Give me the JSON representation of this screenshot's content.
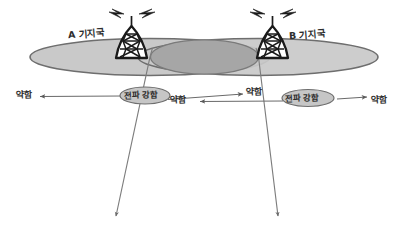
{
  "diagram": {
    "colors": {
      "coverage_fill": "#c9c9c9",
      "overlap_fill": "#a8a8a8",
      "outline": "#6e6e6e",
      "ink": "#333333",
      "background": "#ffffff"
    },
    "stations": [
      {
        "id": "station-a",
        "label": "A 기지국",
        "tower_x": 130,
        "tower_y": 22
      },
      {
        "id": "station-b",
        "label": "B 기지국",
        "tower_x": 272,
        "tower_y": 22
      }
    ],
    "coverage": [
      {
        "id": "coverage-a",
        "cx": 150,
        "cy": 57,
        "rx": 120,
        "ry": 18
      },
      {
        "id": "coverage-b",
        "cx": 258,
        "cy": 57,
        "rx": 120,
        "ry": 18
      }
    ],
    "overlap": {
      "id": "overlap-region",
      "cx": 204,
      "cy": 57,
      "rx": 54,
      "ry": 17
    },
    "signal_labels": [
      {
        "id": "weak-far-left",
        "text": "약함"
      },
      {
        "id": "strong-a",
        "text": "전파 강함"
      },
      {
        "id": "weak-mid-left",
        "text": "약함"
      },
      {
        "id": "weak-mid-right",
        "text": "약함"
      },
      {
        "id": "strong-b",
        "text": "전파 강함"
      },
      {
        "id": "weak-far-right",
        "text": "약함"
      }
    ],
    "arrows": [
      {
        "id": "arrow-a-left",
        "x1": 120,
        "y1": 96,
        "x2": 38,
        "y2": 96,
        "head": "start"
      },
      {
        "id": "arrow-a-right",
        "x1": 186,
        "y1": 99,
        "x2": 300,
        "y2": 93,
        "head": "end"
      },
      {
        "id": "arrow-b-left",
        "x1": 282,
        "y1": 101,
        "x2": 198,
        "y2": 101,
        "head": "start"
      },
      {
        "id": "arrow-b-right",
        "x1": 340,
        "y1": 99,
        "x2": 366,
        "y2": 99,
        "head": "end"
      }
    ],
    "boundary_lines": [
      {
        "id": "boundary-left",
        "x1": 152,
        "y1": 57,
        "x2": 115,
        "y2": 216
      },
      {
        "id": "boundary-right",
        "x1": 257,
        "y1": 57,
        "x2": 278,
        "y2": 216
      }
    ]
  }
}
